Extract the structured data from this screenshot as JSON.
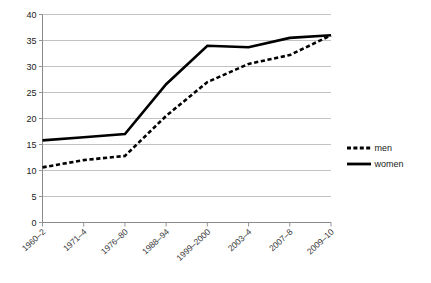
{
  "chart_data": {
    "type": "line",
    "title": "",
    "subtitle": "",
    "xlabel": "",
    "ylabel": "",
    "ylim": [
      0,
      40
    ],
    "ytick_step": 5,
    "yticks": [
      "0",
      "5",
      "10",
      "15",
      "20",
      "25",
      "30",
      "35",
      "40"
    ],
    "grid": true,
    "legend_position": "right",
    "categories": [
      "1960–2",
      "1971–4",
      "1976–80",
      "1988–94",
      "1999–2000",
      "2003–4",
      "2007–8",
      "2009–10"
    ],
    "series": [
      {
        "name": "men",
        "style": "dotted",
        "color": "#000000",
        "values": [
          10.6,
          12.0,
          12.8,
          20.5,
          27.0,
          30.5,
          32.2,
          36.0
        ]
      },
      {
        "name": "women",
        "style": "solid",
        "color": "#000000",
        "values": [
          15.8,
          16.4,
          17.0,
          26.6,
          34.0,
          33.7,
          35.5,
          36.0
        ]
      }
    ]
  },
  "legend": {
    "items": [
      {
        "label": "men",
        "style": "dotted"
      },
      {
        "label": "women",
        "style": "solid"
      }
    ]
  },
  "colors": {
    "gridline": "#b4b4b4",
    "axis": "#8a8a8a",
    "series": "#000000",
    "background": "#ffffff"
  }
}
